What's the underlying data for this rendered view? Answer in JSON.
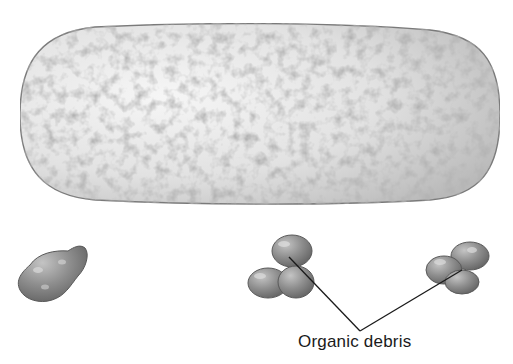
{
  "figure": {
    "objects": [
      {
        "id": "rod",
        "shape": "elongated capsule",
        "name": "large-rod-object"
      },
      {
        "id": "debris-1",
        "shape": "irregular clump",
        "name": "debris-clump-left"
      },
      {
        "id": "debris-2",
        "shape": "lobed clump",
        "name": "debris-clump-center"
      },
      {
        "id": "debris-3",
        "shape": "lobed clump",
        "name": "debris-clump-right"
      }
    ],
    "annotation": {
      "label": "Organic debris",
      "points_to": [
        "debris-2",
        "debris-3"
      ]
    },
    "colors": {
      "background": "#ffffff",
      "rod_fill": "#e4e4e4",
      "rod_edge": "#7a7a7a",
      "debris_fill": "#8c8c8c",
      "debris_edge": "#5a5a5a",
      "leader_line": "#1a1a1a",
      "label_text": "#1a1a1a"
    }
  }
}
